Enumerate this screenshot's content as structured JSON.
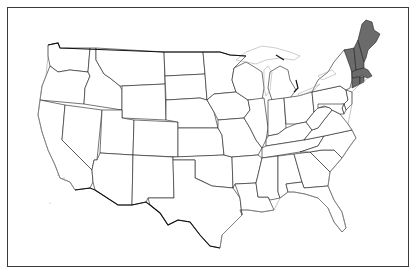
{
  "map": {
    "title": "",
    "region_highlighted": "New England",
    "highlight_color": "#6b6b6b",
    "base_fill": "#ffffff",
    "outline_color": "#1a1a1a",
    "frame_color": "#3a3a3a",
    "highlighted_states": [
      "Maine",
      "New Hampshire",
      "Vermont",
      "Massachusetts",
      "Rhode Island",
      "Connecticut"
    ],
    "states": [
      "Washington",
      "Oregon",
      "California",
      "Idaho",
      "Nevada",
      "Montana",
      "Wyoming",
      "Utah",
      "Arizona",
      "Colorado",
      "New Mexico",
      "North Dakota",
      "South Dakota",
      "Nebraska",
      "Kansas",
      "Oklahoma",
      "Texas",
      "Minnesota",
      "Iowa",
      "Missouri",
      "Arkansas",
      "Louisiana",
      "Wisconsin",
      "Illinois",
      "Michigan",
      "Indiana",
      "Ohio",
      "Kentucky",
      "Tennessee",
      "Mississippi",
      "Alabama",
      "Georgia",
      "Florida",
      "South Carolina",
      "North Carolina",
      "Virginia",
      "West Virginia",
      "Pennsylvania",
      "New York",
      "New Jersey",
      "Delaware",
      "Maryland",
      "Vermont",
      "New Hampshire",
      "Maine",
      "Massachusetts",
      "Rhode Island",
      "Connecticut"
    ]
  }
}
